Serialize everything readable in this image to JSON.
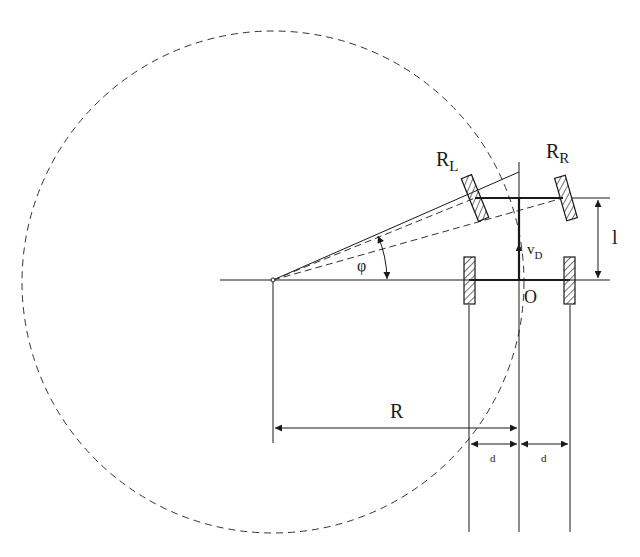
{
  "diagram": {
    "labels": {
      "left_wheel": "R",
      "left_wheel_sub": "L",
      "right_wheel": "R",
      "right_wheel_sub": "R",
      "wheelbase": "l",
      "velocity": "v",
      "velocity_sub": "D",
      "origin": "O",
      "angle": "φ",
      "radius": "R",
      "half_track_left": "d",
      "half_track_right": "d"
    },
    "colors": {
      "line": "#1a1a1a",
      "dashed": "#333333",
      "background": "#ffffff"
    }
  }
}
